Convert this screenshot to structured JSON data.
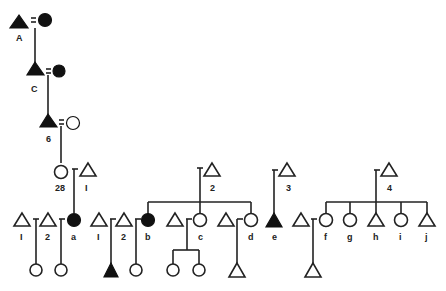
{
  "diagram": {
    "type": "kinship-chart",
    "marriage_symbol": "=",
    "sibling_link_symbol": "–",
    "colors": {
      "ink": "#222222",
      "filled": "#111111",
      "background": "#ffffff"
    },
    "labels": {
      "A": "A",
      "C": "C",
      "six": "6",
      "twentyeight": "28",
      "one_top": "I",
      "g1_one": "I",
      "g1_two": "2",
      "a": "a",
      "g2_one": "I",
      "g2_two": "2",
      "b": "b",
      "two_mid": "2",
      "c": "c",
      "d": "d",
      "three": "3",
      "e": "e",
      "four": "4",
      "f": "f",
      "g": "g",
      "h": "h",
      "i": "i",
      "j": "j"
    },
    "nodes": [
      {
        "id": "A",
        "shape": "triangle",
        "filled": true,
        "label": "A"
      },
      {
        "id": "A-wife",
        "shape": "circle",
        "filled": true
      },
      {
        "id": "C",
        "shape": "triangle",
        "filled": true,
        "label": "C"
      },
      {
        "id": "C-wife",
        "shape": "circle",
        "filled": true
      },
      {
        "id": "6",
        "shape": "triangle",
        "filled": true,
        "label": "6"
      },
      {
        "id": "6-wife",
        "shape": "circle",
        "filled": false
      },
      {
        "id": "28",
        "shape": "circle",
        "filled": false,
        "label": "28"
      },
      {
        "id": "1",
        "shape": "triangle",
        "filled": false,
        "label": "I"
      },
      {
        "id": "a",
        "shape": "circle",
        "filled": true,
        "label": "a"
      },
      {
        "id": "b",
        "shape": "circle",
        "filled": true,
        "label": "b"
      },
      {
        "id": "c",
        "shape": "circle",
        "filled": false,
        "label": "c"
      },
      {
        "id": "d",
        "shape": "circle",
        "filled": false,
        "label": "d"
      },
      {
        "id": "2",
        "shape": "triangle",
        "filled": false,
        "label": "2"
      },
      {
        "id": "3",
        "shape": "triangle",
        "filled": false,
        "label": "3"
      },
      {
        "id": "e",
        "shape": "triangle",
        "filled": true,
        "label": "e"
      },
      {
        "id": "4",
        "shape": "triangle",
        "filled": false,
        "label": "4"
      },
      {
        "id": "f",
        "shape": "circle",
        "filled": false,
        "label": "f"
      },
      {
        "id": "g",
        "shape": "circle",
        "filled": false,
        "label": "g"
      },
      {
        "id": "h",
        "shape": "triangle",
        "filled": false,
        "label": "h"
      },
      {
        "id": "i",
        "shape": "circle",
        "filled": false,
        "label": "i"
      },
      {
        "id": "j",
        "shape": "triangle",
        "filled": false,
        "label": "j"
      }
    ]
  }
}
